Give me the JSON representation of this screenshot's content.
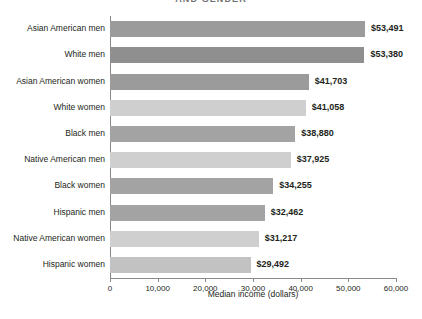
{
  "chart_data": {
    "type": "bar",
    "orientation": "horizontal",
    "title": "AND GENDER",
    "xlabel": "Median income (dollars)",
    "ylabel": "",
    "xlim": [
      0,
      60000
    ],
    "xticks": [
      0,
      10000,
      20000,
      30000,
      40000,
      50000,
      60000
    ],
    "xtick_labels": [
      "0",
      "10,000",
      "20,000",
      "30,000",
      "40,000",
      "50,000",
      "60,000"
    ],
    "grid": false,
    "legend": "none",
    "categories": [
      "Asian American men",
      "White men",
      "Asian American women",
      "White women",
      "Black men",
      "Native American men",
      "Black women",
      "Hispanic men",
      "Native American women",
      "Hispanic women"
    ],
    "values": [
      53491,
      53380,
      41703,
      41058,
      38880,
      37925,
      34255,
      32462,
      31217,
      29492
    ],
    "value_labels": [
      "$53,491",
      "$53,380",
      "$41,703",
      "$41,058",
      "$38,880",
      "$37,925",
      "$34,255",
      "$32,462",
      "$31,217",
      "$29,492"
    ],
    "bar_colors": [
      "#9b9b9b",
      "#8f8f8f",
      "#9b9b9b",
      "#cfcfcf",
      "#a3a3a3",
      "#cfcfcf",
      "#a3a3a3",
      "#a3a3a3",
      "#cfcfcf",
      "#c2c2c2"
    ]
  },
  "colors": {
    "dark_bar": "#9b9b9b",
    "light_bar": "#cfcfcf",
    "axis": "#8a8a8a",
    "text": "#231f20",
    "title": "#6f7072",
    "background": "#ffffff"
  }
}
